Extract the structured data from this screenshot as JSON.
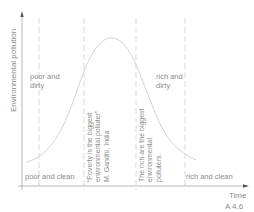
{
  "axes": {
    "y_label": "Environmental pollution",
    "x_label": "Time"
  },
  "figure_id": "A 4.6",
  "zones": {
    "poor_and_dirty": [
      "poor and",
      "dirty"
    ],
    "rich_and_dirty": [
      "rich and",
      "dirty"
    ],
    "poor_and_clean": "poor and clean",
    "rich_and_clean": "rich and clean"
  },
  "quotes": {
    "gandhi": [
      "“Poverty is the biggest",
      "environmental polluter”",
      "M. Gandhi, India"
    ],
    "rich": [
      "The rich are the biggest",
      "environmental",
      "polluters."
    ]
  },
  "colors": {
    "axis": "#8a8a8a",
    "dashed": "#c8c8c8",
    "curve": "#d0d0d0",
    "text": "#8c8c8c"
  }
}
